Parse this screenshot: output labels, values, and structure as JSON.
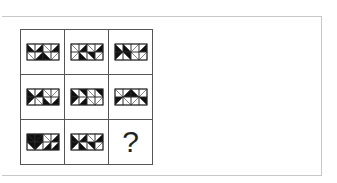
{
  "puzzle": {
    "rows": 3,
    "cols": 3,
    "tile_cells": {
      "cols": 4,
      "rows": 2
    },
    "colors": {
      "fill": "#111111",
      "line": "#555555",
      "frame": "#c8c8c8"
    },
    "tiles": [
      {
        "id": "r1c1",
        "cells": [
          [
            "\\",
            "L"
          ],
          [
            "/",
            "R"
          ],
          [
            "\\",
            ""
          ],
          [
            "/",
            "R"
          ],
          [
            "\\",
            ""
          ],
          [
            "/",
            "B"
          ],
          [
            "\\",
            "B"
          ],
          [
            "/",
            ""
          ]
        ]
      },
      {
        "id": "r1c2",
        "cells": [
          [
            "\\",
            ""
          ],
          [
            "/",
            "R"
          ],
          [
            "\\",
            ""
          ],
          [
            "/",
            "R"
          ],
          [
            "/",
            ""
          ],
          [
            "\\",
            "L"
          ],
          [
            "\\",
            "R"
          ],
          [
            "/",
            ""
          ]
        ]
      },
      {
        "id": "r1c3",
        "cells": [
          [
            "\\",
            "L"
          ],
          [
            "\\",
            "B"
          ],
          [
            "/",
            ""
          ],
          [
            "/",
            "R"
          ],
          [
            "/",
            "L"
          ],
          [
            "\\",
            "R"
          ],
          [
            "\\",
            ""
          ],
          [
            "/",
            ""
          ]
        ]
      },
      {
        "id": "r2c1",
        "cells": [
          [
            "\\",
            "L"
          ],
          [
            "/",
            "R"
          ],
          [
            "\\",
            ""
          ],
          [
            "/",
            ""
          ],
          [
            "/",
            "L"
          ],
          [
            "\\",
            ""
          ],
          [
            "\\",
            "B"
          ],
          [
            "/",
            "B"
          ]
        ]
      },
      {
        "id": "r2c2",
        "cells": [
          [
            "\\",
            "L"
          ],
          [
            "\\",
            "R"
          ],
          [
            "\\",
            ""
          ],
          [
            "\\",
            "R"
          ],
          [
            "/",
            "L"
          ],
          [
            "/",
            "R"
          ],
          [
            "\\",
            ""
          ],
          [
            "/",
            ""
          ]
        ]
      },
      {
        "id": "r2c3",
        "cells": [
          [
            "\\",
            ""
          ],
          [
            "/",
            "B"
          ],
          [
            "\\",
            "B"
          ],
          [
            "/",
            ""
          ],
          [
            "/",
            "L"
          ],
          [
            "\\",
            ""
          ],
          [
            "/",
            ""
          ],
          [
            "\\",
            "R"
          ]
        ]
      },
      {
        "id": "r3c1",
        "cells": [
          [
            "\\",
            "F"
          ],
          [
            "/",
            "F"
          ],
          [
            "\\",
            ""
          ],
          [
            "/",
            "R"
          ],
          [
            "\\",
            "T"
          ],
          [
            "/",
            "T"
          ],
          [
            "/",
            "B"
          ],
          [
            "/",
            "B"
          ]
        ]
      },
      {
        "id": "r3c2",
        "cells": [
          [
            "\\",
            "L"
          ],
          [
            "/",
            "R"
          ],
          [
            "\\",
            ""
          ],
          [
            "/",
            "R"
          ],
          [
            "/",
            "L"
          ],
          [
            "\\",
            "L"
          ],
          [
            "\\",
            "R"
          ],
          [
            "/",
            ""
          ]
        ]
      }
    ],
    "missing": {
      "id": "r3c3",
      "label": "?"
    }
  }
}
